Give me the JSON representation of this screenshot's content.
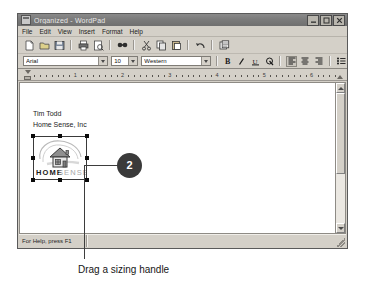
{
  "window": {
    "title": "Organized - WordPad",
    "icon": "wordpad-document-icon",
    "controls": {
      "minimize": "Minimize",
      "maximize": "Maximize",
      "close": "Close"
    }
  },
  "menubar": {
    "items": [
      {
        "label": "File"
      },
      {
        "label": "Edit"
      },
      {
        "label": "View"
      },
      {
        "label": "Insert"
      },
      {
        "label": "Format"
      },
      {
        "label": "Help"
      }
    ]
  },
  "toolbar": {
    "buttons": [
      {
        "name": "new-icon",
        "title": "New"
      },
      {
        "name": "open-icon",
        "title": "Open"
      },
      {
        "name": "save-icon",
        "title": "Save"
      },
      {
        "name": "print-icon",
        "title": "Print"
      },
      {
        "name": "print-preview-icon",
        "title": "Print Preview"
      },
      {
        "name": "find-icon",
        "title": "Find"
      },
      {
        "name": "cut-icon",
        "title": "Cut"
      },
      {
        "name": "copy-icon",
        "title": "Copy"
      },
      {
        "name": "paste-icon",
        "title": "Paste"
      },
      {
        "name": "undo-icon",
        "title": "Undo"
      },
      {
        "name": "date-time-icon",
        "title": "Date/Time"
      }
    ]
  },
  "formatbar": {
    "font": {
      "value": "Arial",
      "placeholder": "Font"
    },
    "size": {
      "value": "10",
      "placeholder": "Size"
    },
    "script": {
      "value": "Western",
      "placeholder": "Script"
    },
    "buttons": [
      {
        "name": "bold-icon",
        "label": "B",
        "pressed": false
      },
      {
        "name": "italic-icon",
        "label": "I",
        "pressed": false
      },
      {
        "name": "underline-icon",
        "label": "U",
        "pressed": false
      },
      {
        "name": "text-color-icon",
        "label": "C",
        "pressed": false
      },
      {
        "name": "align-left-icon",
        "label": "L",
        "pressed": true
      },
      {
        "name": "align-center-icon",
        "label": "C",
        "pressed": false
      },
      {
        "name": "align-right-icon",
        "label": "R",
        "pressed": false
      },
      {
        "name": "bullets-icon",
        "label": "B",
        "pressed": false
      }
    ]
  },
  "ruler": {
    "marks": [
      "1",
      "2",
      "3",
      "4",
      "5",
      "6"
    ],
    "unit": "inches"
  },
  "document": {
    "lines": [
      "Tim Todd",
      "Home Sense, Inc"
    ],
    "image": {
      "name": "home-sense-logo",
      "alt_text": "HOME SENSE",
      "brand_word_1": "HOME",
      "brand_word_2": "SENSE",
      "selected": true,
      "handles": [
        "nw",
        "n",
        "ne",
        "w",
        "e",
        "sw",
        "s",
        "se"
      ]
    }
  },
  "statusbar": {
    "text": "For Help, press F1"
  },
  "annotations": {
    "callout_number": "2",
    "caption": "Drag a sizing handle"
  },
  "colors": {
    "window_face": "#d4d0c8",
    "titlebar": "#7b7b7b",
    "page": "#ffffff",
    "callout_badge": "#3a3a3a",
    "callout_text": "#ffffff",
    "handle": "#0b0b0b"
  }
}
